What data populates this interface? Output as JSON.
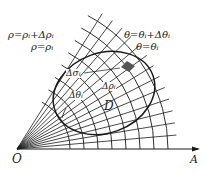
{
  "diagram": {
    "origin_label": "O",
    "axis_label": "A",
    "region_label": "D",
    "labels": {
      "rho_outer": "ρ=ρᵢ+Δρᵢ",
      "rho_inner": "ρ=ρᵢ",
      "theta_outer": "θ=θᵢ+Δθᵢ",
      "theta_inner": "θ=θᵢ",
      "delta_sigma": "Δσᵢ",
      "delta_rho": "Δρᵢ",
      "delta_theta": "Δθᵢ"
    },
    "colors": {
      "ink": "#1a1a1a",
      "background": "#ffffff",
      "shaded_cell": "#555555"
    }
  }
}
